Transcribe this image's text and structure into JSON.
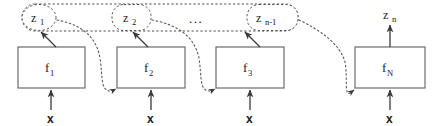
{
  "diagram": {
    "type": "block-diagram",
    "canvas": {
      "width": 437,
      "height": 126,
      "background": "#ffffff"
    },
    "colors": {
      "box_stroke": "#6b6b6b",
      "dashed_stroke": "#4d4d4d",
      "dotted_stroke": "#5a5a5a",
      "arrow": "#3a3a3a",
      "text": "#1a1a1a",
      "background": "#ffffff"
    },
    "blocks": [
      {
        "id": "f1",
        "label": "f",
        "sub": "1",
        "x": 18,
        "y": 47,
        "w": 67,
        "h": 41
      },
      {
        "id": "f2",
        "label": "f",
        "sub": "2",
        "x": 117,
        "y": 47,
        "w": 68,
        "h": 41
      },
      {
        "id": "f3",
        "label": "f",
        "sub": "3",
        "x": 216,
        "y": 47,
        "w": 68,
        "h": 41
      },
      {
        "id": "fN",
        "label": "f",
        "sub": "N",
        "x": 355,
        "y": 47,
        "w": 70,
        "h": 41
      }
    ],
    "latents": [
      {
        "id": "z1",
        "label": "z",
        "sub": "1",
        "cx": 39,
        "cy": 17,
        "rx": 18,
        "ry": 13
      },
      {
        "id": "z2",
        "label": "z",
        "sub": "2",
        "cx": 131,
        "cy": 17,
        "rx": 18,
        "ry": 13
      },
      {
        "id": "zn_1",
        "label": "z",
        "sub": "n-1",
        "cx": 272,
        "cy": 17,
        "rx": 25,
        "ry": 13
      },
      {
        "id": "zn",
        "label": "z",
        "sub": "n",
        "cx": 390,
        "cy": 14,
        "rx": 0,
        "ry": 0
      }
    ],
    "latent_container": {
      "x": 22,
      "y": 4,
      "w": 276,
      "h": 27,
      "rx": 13
    },
    "ellipsis": {
      "text": "...",
      "x": 196,
      "y": 21
    },
    "inputs": [
      {
        "id": "x1",
        "label": "x",
        "x": 51,
        "y": 120
      },
      {
        "id": "x2",
        "label": "x",
        "x": 151,
        "y": 120
      },
      {
        "id": "x3",
        "label": "x",
        "x": 250,
        "y": 120
      },
      {
        "id": "xN",
        "label": "x",
        "x": 390,
        "y": 120
      }
    ],
    "edges": [
      {
        "id": "f1-to-z1",
        "kind": "solid-arrow",
        "from": "f1",
        "to": "z1"
      },
      {
        "id": "f2-to-z2",
        "kind": "solid-arrow",
        "from": "f2",
        "to": "z2"
      },
      {
        "id": "f3-to-zn_1",
        "kind": "solid-arrow",
        "from": "f3",
        "to": "zn_1"
      },
      {
        "id": "fN-to-zn",
        "kind": "solid-arrow",
        "from": "fN",
        "to": "zn"
      },
      {
        "id": "x-to-f1",
        "kind": "solid-arrow",
        "from": "x1",
        "to": "f1"
      },
      {
        "id": "x-to-f2",
        "kind": "solid-arrow",
        "from": "x2",
        "to": "f2"
      },
      {
        "id": "x-to-f3",
        "kind": "solid-arrow",
        "from": "x3",
        "to": "f3"
      },
      {
        "id": "x-to-fN",
        "kind": "solid-arrow",
        "from": "xN",
        "to": "fN"
      },
      {
        "id": "z1-to-f2",
        "kind": "dotted-curve",
        "from": "z1",
        "to": "f2"
      },
      {
        "id": "z2-to-f3",
        "kind": "dotted-curve",
        "from": "z2",
        "to": "f3"
      },
      {
        "id": "zn_1-to-fN",
        "kind": "dotted-curve",
        "from": "zn_1",
        "to": "fN"
      }
    ]
  }
}
